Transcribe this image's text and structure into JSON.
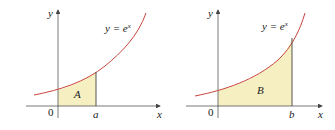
{
  "panels": [
    {
      "curve_label": "y = e",
      "curve_exp": "x",
      "region_label": "A",
      "x_axis_label": "x",
      "y_axis_label": "y",
      "origin_label": "0",
      "bound_label": "a"
    },
    {
      "curve_label": "y = e",
      "curve_exp": "x",
      "region_label": "B",
      "x_axis_label": "x",
      "y_axis_label": "y",
      "origin_label": "0",
      "bound_label": "b"
    }
  ],
  "colors": {
    "curve": "#c8463f",
    "fill": "#f6efc2",
    "axis": "#555555",
    "bound_line": "#444444"
  }
}
